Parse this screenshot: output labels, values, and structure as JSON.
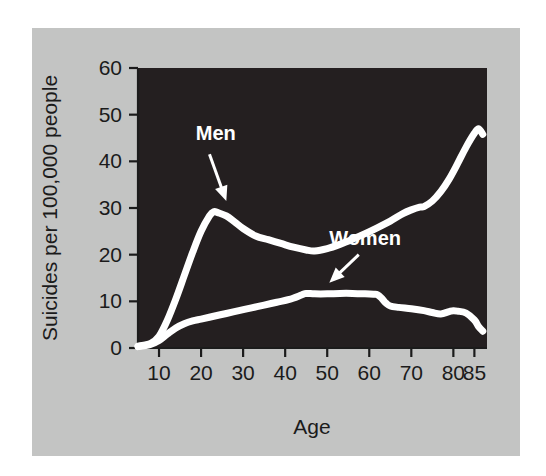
{
  "figure": {
    "panel_background": "#c3c4c3",
    "plot_background": "#241f20",
    "line_color": "#ffffff",
    "text_color": "#1b1b1b"
  },
  "chart_data": {
    "type": "line",
    "title": "",
    "subtitle": "",
    "xlabel": "Age",
    "ylabel": "Suicides per 100,000 people",
    "xlim": [
      5,
      88
    ],
    "ylim": [
      0,
      60
    ],
    "xticks": [
      10,
      20,
      30,
      40,
      50,
      60,
      70,
      80,
      85
    ],
    "xticklabels": [
      "10",
      "20",
      "30",
      "40",
      "50",
      "60",
      "70",
      "80",
      "85"
    ],
    "yticks": [
      0,
      10,
      20,
      30,
      40,
      50,
      60
    ],
    "yticklabels": [
      "0",
      "10",
      "20",
      "30",
      "40",
      "50",
      "60"
    ],
    "grid": false,
    "legend": "none",
    "annotations": [
      {
        "label": "Men",
        "text_x": 23.5,
        "text_y": 44.5,
        "arrow_from_x": 22.0,
        "arrow_from_y": 41.5,
        "arrow_to_x": 26.0,
        "arrow_to_y": 31.5
      },
      {
        "label": "Women",
        "text_x": 59.0,
        "text_y": 22.0,
        "arrow_from_x": 57.5,
        "arrow_from_y": 20.0,
        "arrow_to_x": 50.5,
        "arrow_to_y": 14.0
      }
    ],
    "series": [
      {
        "name": "Men",
        "color": "#ffffff",
        "x": [
          5,
          8,
          10,
          12,
          14,
          16,
          18,
          20,
          22,
          23,
          24,
          26,
          28,
          30,
          33,
          36,
          39,
          42,
          45,
          47,
          50,
          53,
          56,
          59,
          62,
          65,
          68,
          70,
          72,
          73,
          75,
          77,
          79,
          81,
          83,
          85,
          86,
          87
        ],
        "y": [
          0.4,
          1.0,
          2.5,
          6.0,
          10.5,
          15.5,
          20.5,
          25.0,
          28.3,
          29.2,
          29.0,
          28.3,
          27.0,
          25.6,
          24.0,
          23.2,
          22.4,
          21.6,
          21.0,
          20.8,
          21.3,
          22.2,
          23.3,
          24.5,
          25.8,
          27.2,
          28.8,
          29.6,
          30.2,
          30.3,
          31.5,
          33.5,
          36.2,
          39.5,
          43.0,
          46.0,
          47.0,
          45.8
        ]
      },
      {
        "name": "Women",
        "color": "#ffffff",
        "x": [
          5,
          8,
          10,
          12,
          14,
          16,
          18,
          20,
          23,
          26,
          29,
          32,
          35,
          38,
          41,
          44,
          45,
          47,
          50,
          53,
          56,
          59,
          61,
          62,
          63,
          64,
          65,
          67,
          70,
          73,
          75,
          77,
          79,
          80,
          81,
          83,
          85,
          86,
          87
        ],
        "y": [
          0.3,
          0.8,
          1.6,
          3.0,
          4.3,
          5.2,
          5.8,
          6.2,
          6.8,
          7.4,
          8.0,
          8.6,
          9.2,
          9.8,
          10.4,
          11.4,
          11.7,
          11.6,
          11.6,
          11.7,
          11.7,
          11.6,
          11.5,
          11.4,
          10.6,
          9.6,
          9.0,
          8.7,
          8.4,
          8.0,
          7.6,
          7.3,
          7.8,
          8.0,
          7.9,
          7.5,
          6.0,
          4.6,
          3.6
        ]
      }
    ]
  }
}
